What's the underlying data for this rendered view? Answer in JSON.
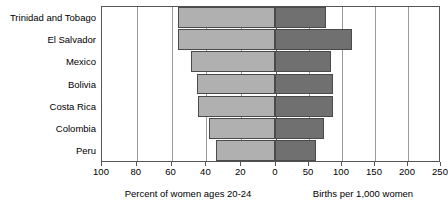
{
  "chart_data": {
    "type": "bar",
    "orientation": "horizontal",
    "layout": "back-to-back pyramid",
    "title": "",
    "categories": [
      "Trinidad and Tobago",
      "El Salvador",
      "Mexico",
      "Bolivia",
      "Costa Rica",
      "Colombia",
      "Peru"
    ],
    "series": [
      {
        "name": "Percent of women ages 20-24",
        "side": "left",
        "color": "#b0b0b0",
        "values": [
          56,
          56,
          48,
          45,
          44,
          38,
          34
        ],
        "axis": {
          "label": "Percent of women ages 20-24",
          "ticks": [
            100,
            80,
            60,
            40,
            20,
            0
          ],
          "tick_labels": [
            "100",
            "80",
            "60",
            "40",
            "20",
            "0"
          ],
          "range": [
            100,
            0
          ],
          "direction": "reversed"
        }
      },
      {
        "name": "Births per 1,000 women",
        "side": "right",
        "color": "#707070",
        "values": [
          77,
          117,
          85,
          88,
          88,
          74,
          62
        ],
        "axis": {
          "label": "Births per 1,000 women",
          "ticks": [
            0,
            50,
            100,
            150,
            200,
            250
          ],
          "tick_labels": [
            "0",
            "50",
            "100",
            "150",
            "200",
            "250"
          ],
          "range": [
            0,
            250
          ],
          "direction": "normal"
        }
      }
    ],
    "grid": true,
    "legend": "none",
    "xlabel_left": "Percent of women ages 20-24",
    "xlabel_right": "Births per 1,000 women",
    "ylabel": ""
  },
  "axis_captions": {
    "left": "Percent of women ages 20-24",
    "right": "Births per 1,000 women"
  }
}
